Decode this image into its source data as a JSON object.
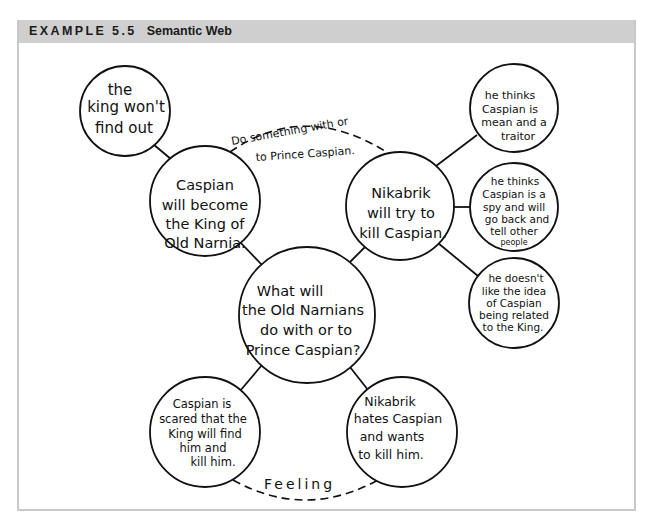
{
  "header": {
    "example_label": "EXAMPLE 5.5",
    "title": "Semantic Web"
  },
  "diagram": {
    "center": {
      "lines": [
        "What will",
        "the Old Narnians",
        "do with or to",
        "Prince Caspian?"
      ]
    },
    "nodes": {
      "caspian_king": {
        "lines": [
          "Caspian",
          "will become",
          "the King of",
          "Old Narnia."
        ]
      },
      "king_wont_find": {
        "lines": [
          "the",
          "king won't",
          "find out"
        ]
      },
      "nikabrik_kill": {
        "lines": [
          "Nikabrik",
          "will try to",
          "kill Caspian."
        ]
      },
      "mean_traitor": {
        "lines": [
          "he thinks",
          "Caspian is",
          "mean and a",
          "traitor"
        ]
      },
      "spy": {
        "lines": [
          "he thinks",
          "Caspian is a",
          "spy and will",
          "go back and",
          "tell other",
          "people"
        ]
      },
      "related_king": {
        "lines": [
          "he doesn't",
          "like the idea",
          "of Caspian",
          "being related",
          "to the King."
        ]
      },
      "scared": {
        "lines": [
          "Caspian is",
          "scared that the",
          "King will find",
          "him and",
          "kill him."
        ]
      },
      "hates": {
        "lines": [
          "Nikabrik",
          "hates Caspian",
          "and wants",
          "to kill him."
        ]
      }
    },
    "link_labels": {
      "top_line1": "Do something with or",
      "top_line2": "to Prince Caspian.",
      "bottom": "Feeling"
    }
  }
}
